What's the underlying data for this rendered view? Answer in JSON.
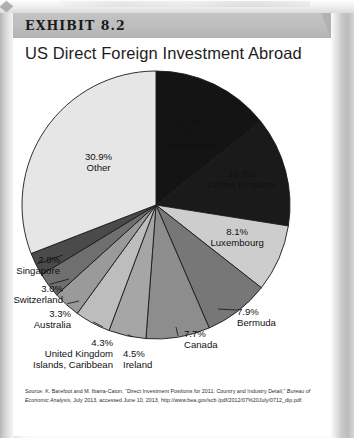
{
  "exhibit": {
    "label": "EXHIBIT 8.2",
    "title": "US Direct Foreign Investment Abroad"
  },
  "source": {
    "line1_a": "Source: K. Barefoot and M. Ibarra-Caton, “Direct Investment Positions for 2011: Country and Industry Detail,” ",
    "line1_italic": "Bureau of Economic Analysis",
    "line1_b": ", July 2013, accessed June 10, 2013, http://www.bea.gov/scb /pdf/2012/07%20July/0712_dip.pdf."
  },
  "chart_data": {
    "type": "pie",
    "title": "US Direct Foreign Investment Abroad",
    "units": "percent",
    "start_angle_deg": 0,
    "direction": "clockwise",
    "legend": "none (labels on slices and with leader lines)",
    "categories": [
      "The Netherlands",
      "United Kingdom",
      "Luxembourg",
      "Bermuda",
      "Canada",
      "Ireland",
      "United Kingdom Islands, Caribbean",
      "Australia",
      "Switzerland",
      "Singapore",
      "Other"
    ],
    "values": [
      14.3,
      13.2,
      8.1,
      7.9,
      7.7,
      4.5,
      4.3,
      3.3,
      3.0,
      2.8,
      30.9
    ],
    "colors": [
      "#141414",
      "#1a1a1a",
      "#cdcdcd",
      "#777777",
      "#8d8d8d",
      "#a6a6a6",
      "#bdbdbd",
      "#9a9a9a",
      "#6f6f6f",
      "#4a4a4a",
      "#e6e6e6"
    ],
    "slices": [
      {
        "label": "The Netherlands",
        "value": 14.3,
        "value_text": "14.3%",
        "label_line1": "The",
        "label_line2": "Netherlands",
        "color": "#141414",
        "label_placement": "inside",
        "label_color": "#ffffff"
      },
      {
        "label": "United Kingdom",
        "value": 13.2,
        "value_text": "13.2%",
        "label_line1": "United Kingdom",
        "label_line2": "",
        "color": "#1a1a1a",
        "label_placement": "inside",
        "label_color": "#ffffff"
      },
      {
        "label": "Luxembourg",
        "value": 8.1,
        "value_text": "8.1%",
        "label_line1": "Luxembourg",
        "label_line2": "",
        "color": "#cdcdcd",
        "label_placement": "inside",
        "label_color": "#111111"
      },
      {
        "label": "Bermuda",
        "value": 7.9,
        "value_text": "7.9%",
        "label_line1": "Bermuda",
        "label_line2": "",
        "color": "#777777",
        "label_placement": "outside",
        "label_color": "#111111"
      },
      {
        "label": "Canada",
        "value": 7.7,
        "value_text": "7.7%",
        "label_line1": "Canada",
        "label_line2": "",
        "color": "#8d8d8d",
        "label_placement": "outside",
        "label_color": "#111111"
      },
      {
        "label": "Ireland",
        "value": 4.5,
        "value_text": "4.5%",
        "label_line1": "Ireland",
        "label_line2": "",
        "color": "#a6a6a6",
        "label_placement": "outside",
        "label_color": "#111111"
      },
      {
        "label": "United Kingdom Islands, Caribbean",
        "value": 4.3,
        "value_text": "4.3%",
        "label_line1": "United Kingdom",
        "label_line2": "Islands, Caribbean",
        "color": "#bdbdbd",
        "label_placement": "outside",
        "label_color": "#111111"
      },
      {
        "label": "Australia",
        "value": 3.3,
        "value_text": "3.3%",
        "label_line1": "Australia",
        "label_line2": "",
        "color": "#9a9a9a",
        "label_placement": "outside",
        "label_color": "#111111"
      },
      {
        "label": "Switzerland",
        "value": 3.0,
        "value_text": "3.0%",
        "label_line1": "Switzerland",
        "label_line2": "",
        "color": "#6f6f6f",
        "label_placement": "outside",
        "label_color": "#111111"
      },
      {
        "label": "Singapore",
        "value": 2.8,
        "value_text": "2.8%",
        "label_line1": "Singapore",
        "label_line2": "",
        "color": "#4a4a4a",
        "label_placement": "outside",
        "label_color": "#111111"
      },
      {
        "label": "Other",
        "value": 30.9,
        "value_text": "30.9%",
        "label_line1": "Other",
        "label_line2": "",
        "color": "#e6e6e6",
        "label_placement": "inside",
        "label_color": "#111111"
      }
    ]
  }
}
